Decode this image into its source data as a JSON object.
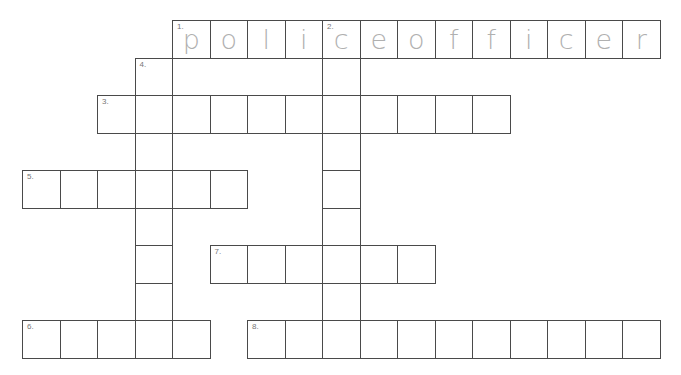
{
  "puzzle": {
    "origin_x": 22,
    "origin_y": 20,
    "cell_size": 37.5,
    "line_color": "#4a4a4a",
    "letter_color": "#b0b0b0",
    "entries": [
      {
        "number": "1.",
        "direction": "across",
        "row": 0,
        "col": 4,
        "length": 13,
        "answer": "policeofficer"
      },
      {
        "number": "2.",
        "direction": "down",
        "row": 0,
        "col": 8,
        "length": 9,
        "answer": ""
      },
      {
        "number": "3.",
        "direction": "across",
        "row": 2,
        "col": 2,
        "length": 11,
        "answer": ""
      },
      {
        "number": "4.",
        "direction": "down",
        "row": 1,
        "col": 3,
        "length": 8,
        "answer": ""
      },
      {
        "number": "5.",
        "direction": "across",
        "row": 4,
        "col": 0,
        "length": 6,
        "answer": ""
      },
      {
        "number": "6.",
        "direction": "across",
        "row": 8,
        "col": 0,
        "length": 5,
        "answer": ""
      },
      {
        "number": "7.",
        "direction": "across",
        "row": 6,
        "col": 5,
        "length": 6,
        "answer": ""
      },
      {
        "number": "8.",
        "direction": "across",
        "row": 8,
        "col": 6,
        "length": 11,
        "answer": ""
      }
    ]
  }
}
